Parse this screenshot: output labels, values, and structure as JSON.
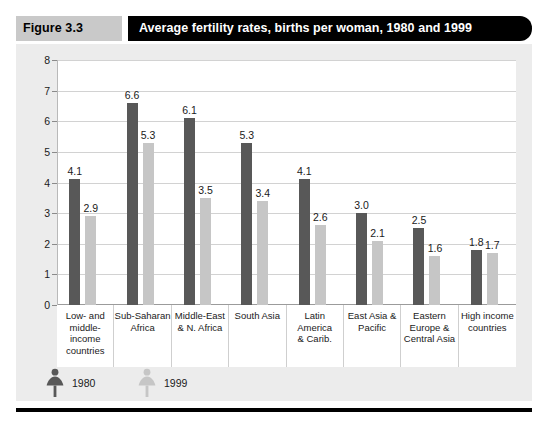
{
  "header": {
    "figure_number": "Figure 3.3",
    "title": "Average fertility rates, births per woman, 1980 and 1999"
  },
  "legend": {
    "items": [
      {
        "label": "1980",
        "color": "#585858",
        "icon": "female-figure-icon"
      },
      {
        "label": "1999",
        "color": "#c6c6c6",
        "icon": "female-figure-icon"
      }
    ]
  },
  "colors": {
    "series_1980": "#585858",
    "series_1999": "#c6c6c6",
    "panel_background": "#ececec",
    "plot_background": "#ffffff",
    "gridline": "#d2d2d2",
    "title_bar": "#000000",
    "figure_number_block": "#c9c9c9"
  },
  "chart_data": {
    "type": "bar",
    "title": "Average fertility rates, births per woman, 1980 and 1999",
    "xlabel": "",
    "ylabel": "",
    "ylim": [
      0,
      8
    ],
    "yticks": [
      0,
      1,
      2,
      3,
      4,
      5,
      6,
      7,
      8
    ],
    "ytick_labels": [
      "0",
      "1",
      "2",
      "3",
      "4",
      "5",
      "6",
      "7",
      "8"
    ],
    "grid": true,
    "legend_position": "bottom-left",
    "categories": [
      "Low- and\nmiddle-\nincome\ncountries",
      "Sub-Saharan\nAfrica",
      "Middle-East\n& N. Africa",
      "South Asia",
      "Latin America\n& Carib.",
      "East Asia &\nPacific",
      "Eastern\nEurope &\nCentral Asia",
      "High income\ncountries"
    ],
    "series": [
      {
        "name": "1980",
        "color": "#585858",
        "values": [
          4.1,
          6.6,
          6.1,
          5.3,
          4.1,
          3.0,
          2.5,
          1.8
        ],
        "labels": [
          "4.1",
          "6.6",
          "6.1",
          "5.3",
          "4.1",
          "3.0",
          "2.5",
          "1.8"
        ]
      },
      {
        "name": "1999",
        "color": "#c6c6c6",
        "values": [
          2.9,
          5.3,
          3.5,
          3.4,
          2.6,
          2.1,
          1.6,
          1.7
        ],
        "labels": [
          "2.9",
          "5.3",
          "3.5",
          "3.4",
          "2.6",
          "2.1",
          "1.6",
          "1.7"
        ]
      }
    ]
  }
}
